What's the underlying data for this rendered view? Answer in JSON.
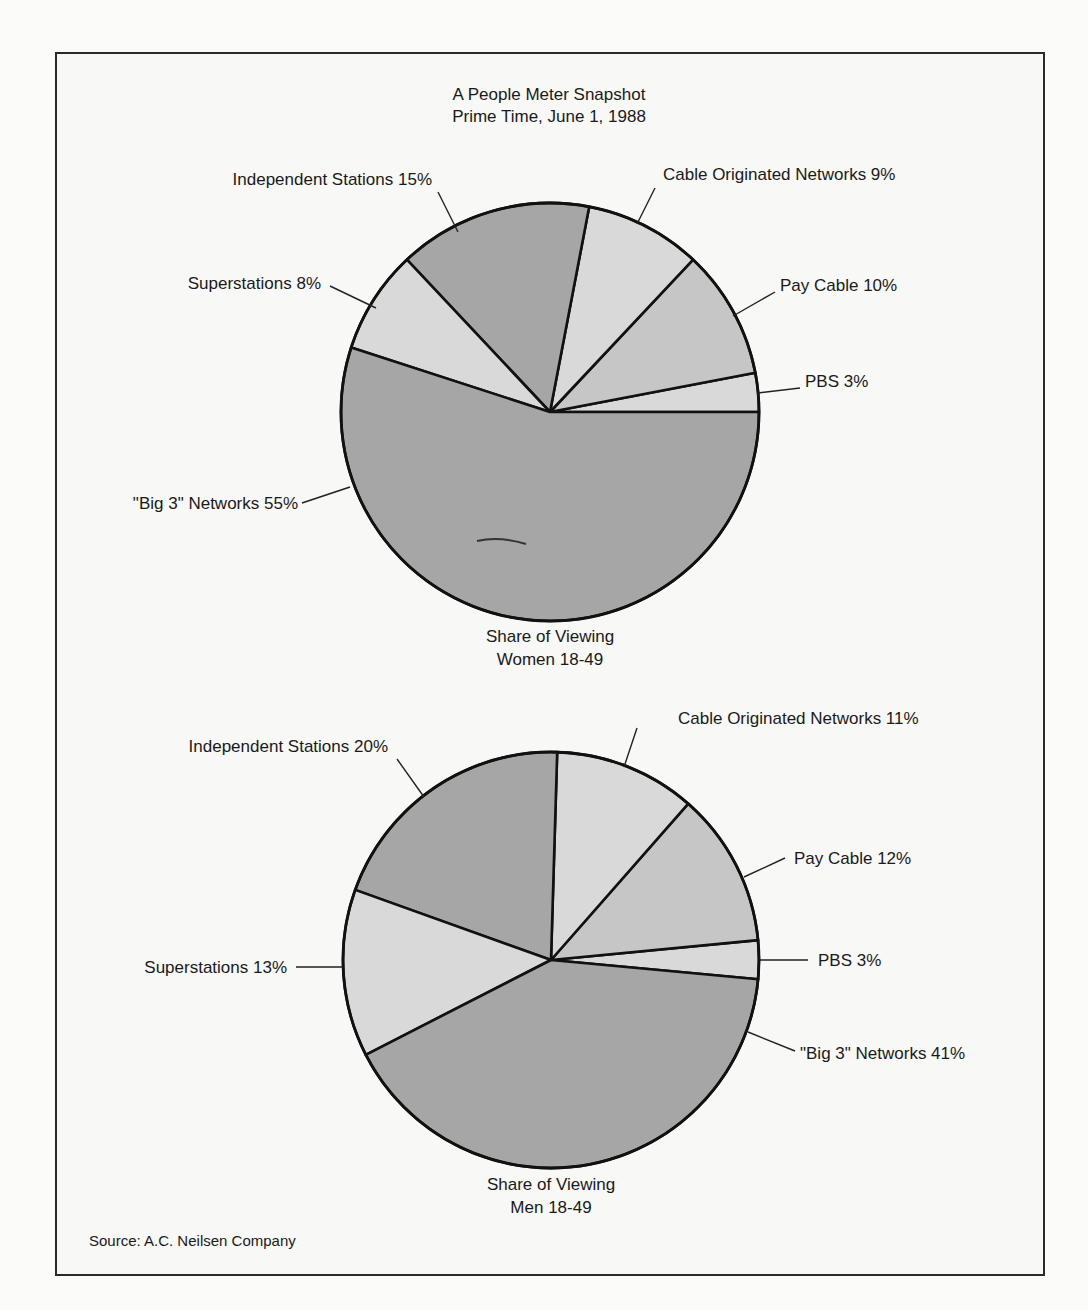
{
  "title": {
    "line1": "A People Meter Snapshot",
    "line2": "Prime Time, June 1, 1988"
  },
  "source": "Source: A.C. Neilsen Company",
  "colors": {
    "dark": "#a6a6a6",
    "medium": "#c6c6c6",
    "light": "#d9d9d9",
    "outline": "#111111"
  },
  "chart_data": [
    {
      "type": "pie",
      "title": "Share of Viewing",
      "subtitle": "Women 18-49",
      "labels": [
        "\"Big 3\" Networks",
        "PBS",
        "Pay Cable",
        "Cable Originated Networks",
        "Independent Stations",
        "Superstations"
      ],
      "values": [
        55,
        3,
        10,
        9,
        15,
        8
      ],
      "label_text": [
        "\"Big 3\" Networks 55%",
        "PBS 3%",
        "Pay Cable 10%",
        "Cable Originated Networks 9%",
        "Independent Stations 15%",
        "Superstations 8%"
      ],
      "unit": "%"
    },
    {
      "type": "pie",
      "title": "Share of Viewing",
      "subtitle": "Men 18-49",
      "labels": [
        "\"Big 3\" Networks",
        "PBS",
        "Pay Cable",
        "Cable Originated Networks",
        "Independent Stations",
        "Superstations"
      ],
      "values": [
        41,
        3,
        12,
        11,
        20,
        13
      ],
      "label_text": [
        "\"Big 3\" Networks 41%",
        "PBS 3%",
        "Pay Cable 12%",
        "Cable Originated Networks 11%",
        "Independent Stations 20%",
        "Superstations 13%"
      ],
      "unit": "%"
    }
  ],
  "women": {
    "caption1": "Share of Viewing",
    "caption2": "Women 18-49",
    "labels": {
      "big3": "\"Big 3\" Networks 55%",
      "pbs": "PBS 3%",
      "pay": "Pay Cable 10%",
      "cable": "Cable Originated Networks 9%",
      "indep": "Independent Stations 15%",
      "super": "Superstations 8%"
    }
  },
  "men": {
    "caption1": "Share of Viewing",
    "caption2": "Men 18-49",
    "labels": {
      "big3": "\"Big 3\" Networks 41%",
      "pbs": "PBS 3%",
      "pay": "Pay Cable 12%",
      "cable": "Cable Originated Networks 11%",
      "indep": "Independent Stations 20%",
      "super": "Superstations 13%"
    }
  }
}
